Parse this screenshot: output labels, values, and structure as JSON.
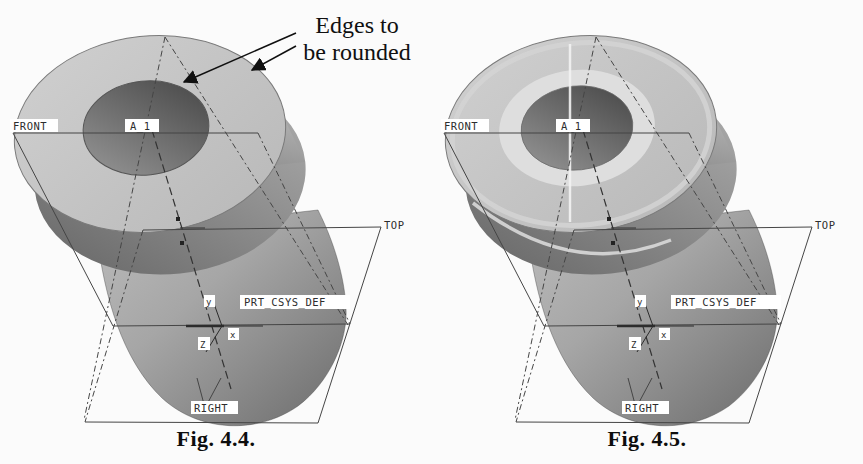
{
  "page": {
    "background": "#fbfbfb"
  },
  "annotation": {
    "line1": "Edges to",
    "line2": "be rounded"
  },
  "figures": [
    {
      "caption": "Fig. 4.4.",
      "rounded": false,
      "labels": {
        "front": "FRONT",
        "axis_a1": "A_1",
        "top": "TOP",
        "csys": "PRT_CSYS_DEF",
        "right": "RIGHT",
        "x_axis": "x",
        "y_axis": "y",
        "z_axis": "Z"
      }
    },
    {
      "caption": "Fig. 4.5.",
      "rounded": true,
      "labels": {
        "front": "FRONT",
        "axis_a1": "A_1",
        "top": "TOP",
        "csys": "PRT_CSYS_DEF",
        "right": "RIGHT",
        "x_axis": "x",
        "y_axis": "y",
        "z_axis": "Z"
      }
    }
  ],
  "colors": {
    "face": "#c6c6c6",
    "hole_dark": "#454545",
    "hole_light": "#989898",
    "flange_dark": "#646464",
    "flange_light": "#b2b2b2",
    "shaft_light": "#bcbcbc",
    "shaft_dark": "#6b6b6b",
    "datum_line": "#454545",
    "round_highlight": "#dedede",
    "text": "#101010",
    "label_bg": "#ffffff"
  }
}
